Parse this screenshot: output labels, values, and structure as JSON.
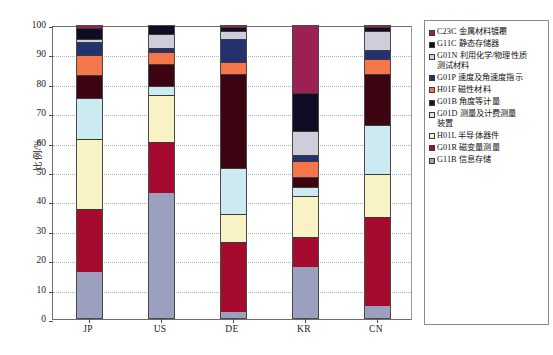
{
  "chart_data": {
    "type": "bar",
    "subtype": "stacked-bar-100",
    "title": "",
    "xlabel": "",
    "ylabel": "比例/%",
    "ylim": [
      0,
      100
    ],
    "yticks": [
      0,
      10,
      20,
      30,
      40,
      50,
      60,
      70,
      80,
      90,
      100
    ],
    "grid": true,
    "legend_position": "right",
    "categories": [
      "JP",
      "US",
      "DE",
      "KR",
      "CN"
    ],
    "series": [
      {
        "name": "G11B 信息存储",
        "code": "G11B",
        "color": "#9ba0bf",
        "values": [
          15.5,
          42.5,
          2.0,
          17.5,
          4.0
        ]
      },
      {
        "name": "G01R 磁变量测量",
        "code": "G01R",
        "color": "#a60a2e",
        "values": [
          21.5,
          17.5,
          24.0,
          10.0,
          30.5
        ]
      },
      {
        "name": "H01L 半导体器件",
        "code": "H01L",
        "color": "#f8f2c4",
        "values": [
          24.0,
          16.0,
          9.5,
          14.0,
          14.5
        ]
      },
      {
        "name": "G01D 测量及计费测量装置",
        "code": "G01D",
        "color": "#cbeaf2",
        "values": [
          14.0,
          3.0,
          15.5,
          3.0,
          16.5
        ]
      },
      {
        "name": "G01B 角度等计量",
        "code": "G01B",
        "color": "#3d0412",
        "values": [
          7.5,
          7.5,
          32.0,
          3.5,
          17.5
        ]
      },
      {
        "name": "H01F 磁性材料",
        "code": "H01F",
        "color": "#f4764a",
        "values": [
          7.0,
          4.0,
          4.0,
          5.5,
          5.0
        ]
      },
      {
        "name": "G01P 速度及角速度指示",
        "code": "G01P",
        "color": "#23316e",
        "values": [
          4.5,
          1.5,
          8.0,
          2.0,
          3.0
        ]
      },
      {
        "name": "G01N 利用化学/物理性质测试材料",
        "code": "G01N",
        "color": "#cdced9",
        "values": [
          1.0,
          4.5,
          2.5,
          8.0,
          6.5
        ]
      },
      {
        "name": "G11C 静态存储器",
        "code": "G11C",
        "color": "#100c26",
        "values": [
          3.5,
          3.0,
          1.5,
          13.0,
          1.5
        ]
      },
      {
        "name": "C23C 金属材料镀覆",
        "code": "C23C",
        "color": "#9c2152",
        "values": [
          1.5,
          0.0,
          1.0,
          23.5,
          1.0
        ]
      }
    ],
    "legend_order_top_to_bottom": [
      "C23C 金属材料镀覆",
      "G11C 静态存储器",
      "G01N 利用化学/物理性质\n测试材料",
      "G01P 速度及角速度指示",
      "H01F 磁性材料",
      "G01B 角度等计量",
      "G01D 测量及计费测量\n装置",
      "H01L 半导体器件",
      "G01R 磁变量测量",
      "G11B 信息存储"
    ]
  },
  "legend": {
    "items": [
      {
        "label": "C23C 金属材料镀覆",
        "color": "#9c2152"
      },
      {
        "label": "G11C 静态存储器",
        "color": "#100c26"
      },
      {
        "label": "G01N 利用化学/物理性质\n  测试材料",
        "color": "#cdced9"
      },
      {
        "label": "G01P 速度及角速度指示",
        "color": "#23316e"
      },
      {
        "label": "H01F 磁性材料",
        "color": "#f4764a"
      },
      {
        "label": "G01B 角度等计量",
        "color": "#3d0412"
      },
      {
        "label": "G01D 测量及计费测量\n  装置",
        "color": "#cbeaf2"
      },
      {
        "label": "H01L 半导体器件",
        "color": "#f8f2c4"
      },
      {
        "label": "G01R 磁变量测量",
        "color": "#a60a2e"
      },
      {
        "label": "G11B 信息存储",
        "color": "#9ba0bf"
      }
    ]
  },
  "footer": {
    "caption": ""
  }
}
